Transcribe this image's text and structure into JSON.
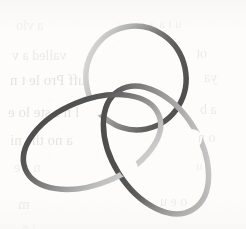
{
  "page": {
    "width": 246,
    "height": 229,
    "background_color": "#fdfcfb",
    "kind": "scanned-book-page-figure",
    "figure_name": "trefoil-knot"
  },
  "figure": {
    "title": "",
    "caption": "",
    "stroke": {
      "width_px": 5.5,
      "darkest_color": "#4a4a4a",
      "mid_color": "#8f8f8f",
      "lightest_color": "#d9d9d9",
      "linecap": "round"
    },
    "geometry": {
      "bounds": {
        "x_min": 22,
        "y_min": 27,
        "x_max": 226,
        "y_max": 214
      },
      "loops": [
        {
          "name": "upper-loop",
          "center": [
            136,
            78
          ],
          "rx": 50,
          "ry": 52,
          "rotation_deg": -12,
          "shade_start": "#d6d6d6",
          "shade_end": "#4f4f4f"
        },
        {
          "name": "left-loop",
          "center": [
            92,
            142
          ],
          "rx": 72,
          "ry": 42,
          "rotation_deg": -22,
          "shade_start": "#4a4a4a",
          "shade_end": "#cfcfcf"
        },
        {
          "name": "right-loop",
          "center": [
            156,
            150
          ],
          "rx": 70,
          "ry": 44,
          "rotation_deg": 58,
          "shade_start": "#b8b8b8",
          "shade_end": "#555555"
        }
      ],
      "crossings": [
        {
          "name": "crossing-left",
          "position": [
            92,
            97
          ],
          "over": "left-loop",
          "under": "upper-loop"
        },
        {
          "name": "crossing-right",
          "position": [
            166,
            113
          ],
          "over": "upper-loop",
          "under": "right-loop"
        },
        {
          "name": "crossing-bottom",
          "position": [
            116,
            180
          ],
          "over": "right-loop",
          "under": "left-loop"
        }
      ]
    }
  },
  "ghost_text": {
    "note": "faint mirrored bleed-through text from the reverse of the scanned sheet",
    "opacity": 0.085,
    "lines": [
      {
        "text": "a vlo",
        "x": 16,
        "y": 18,
        "size": 14,
        "opacity": 0.055
      },
      {
        "text": "u t a a",
        "x": 150,
        "y": 16,
        "size": 13,
        "opacity": 0.05
      },
      {
        "text": "valled a  v",
        "x": 12,
        "y": 48,
        "size": 14,
        "opacity": 0.08
      },
      {
        "text": "ot",
        "x": 196,
        "y": 46,
        "size": 14,
        "opacity": 0.07
      },
      {
        "text": "uff Pro le  t n",
        "x": 10,
        "y": 72,
        "size": 15,
        "opacity": 0.1
      },
      {
        "text": "ya",
        "x": 204,
        "y": 70,
        "size": 14,
        "opacity": 0.07
      },
      {
        "text": "l n s  ste  lo  e",
        "x": 8,
        "y": 104,
        "size": 15,
        "opacity": 0.1
      },
      {
        "text": "a b",
        "x": 200,
        "y": 102,
        "size": 14,
        "opacity": 0.075
      },
      {
        "text": "a  no   the   ni",
        "x": 10,
        "y": 132,
        "size": 15,
        "opacity": 0.095
      },
      {
        "text": "o n",
        "x": 198,
        "y": 130,
        "size": 14,
        "opacity": 0.07
      },
      {
        "text": "n a  e",
        "x": 14,
        "y": 160,
        "size": 14,
        "opacity": 0.06
      },
      {
        "text": "s  u",
        "x": 196,
        "y": 158,
        "size": 13,
        "opacity": 0.05
      },
      {
        "text": "m",
        "x": 18,
        "y": 196,
        "size": 15,
        "opacity": 0.08
      },
      {
        "text": "o  e  u",
        "x": 160,
        "y": 194,
        "size": 14,
        "opacity": 0.065
      },
      {
        "text": "t n",
        "x": 22,
        "y": 220,
        "size": 13,
        "opacity": 0.05
      }
    ]
  }
}
